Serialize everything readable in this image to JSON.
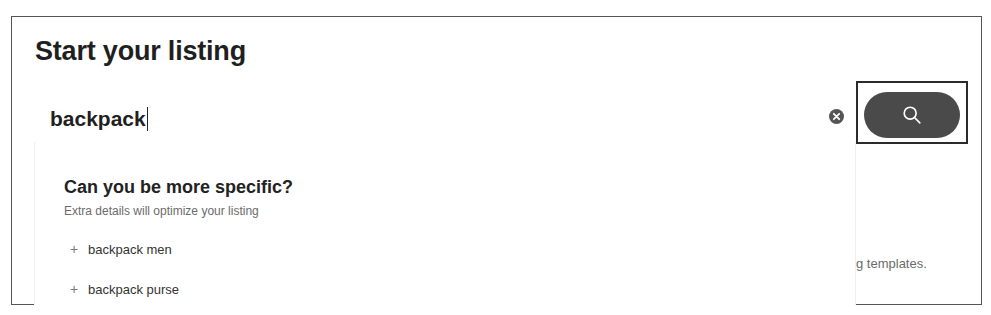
{
  "page": {
    "title": "Start your listing"
  },
  "search": {
    "value": "backpack",
    "placeholder": "",
    "clear_icon": "close-circle-icon",
    "button_icon": "search-icon",
    "button_aria": "Search"
  },
  "suggestions_panel": {
    "title": "Can you be more specific?",
    "subtitle": "Extra details will optimize your listing",
    "items": [
      {
        "prefix_icon": "plus-icon",
        "label": "backpack men"
      },
      {
        "prefix_icon": "plus-icon",
        "label": "backpack purse"
      }
    ]
  },
  "background": {
    "partial_text": "g templates."
  },
  "colors": {
    "text_primary": "#1f1f1f",
    "text_secondary": "#6b6b6b",
    "button_bg": "#4a4a4a",
    "frame_border": "#555555"
  }
}
